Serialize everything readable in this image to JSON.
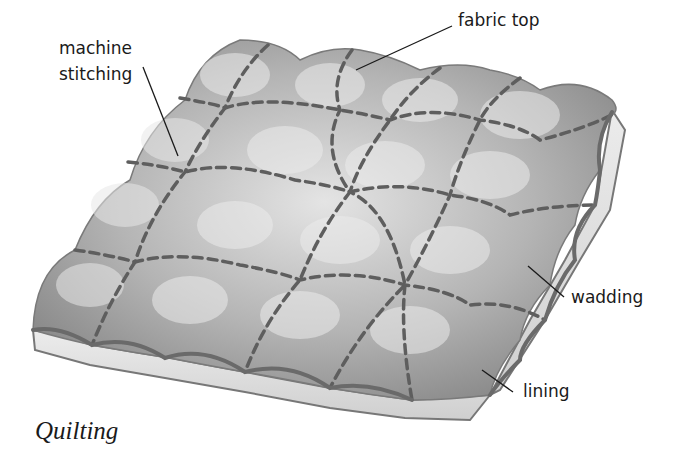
{
  "diagram": {
    "title": "Quilting",
    "colors": {
      "fabric_light": "#d9d9d9",
      "fabric_dark": "#8a8a8a",
      "stitch": "#5e5e5e",
      "edge": "#6a6a6a",
      "wadding": "#e6e6e6",
      "leader": "#1a1a1a"
    },
    "labels": {
      "machine_stitching_line1": "machine",
      "machine_stitching_line2": "stitching",
      "fabric_top": "fabric top",
      "wadding": "wadding",
      "lining": "lining"
    },
    "grid": {
      "rows": 4,
      "cols": 5
    }
  }
}
